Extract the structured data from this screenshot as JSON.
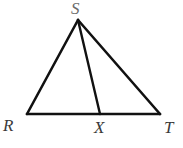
{
  "figure": {
    "background_color": "#ffffff",
    "stroke_color": "#111111",
    "label_color": "#3a3a3a",
    "apex_label_color": "#6b6b6b",
    "stroke_width": 2.6,
    "width": 183,
    "height": 148
  },
  "labels": {
    "apex": "S",
    "bottom_left": "R",
    "bottom_middle": "X",
    "bottom_right": "T"
  },
  "geometry": {
    "points": {
      "S": {
        "x": 78,
        "y": 20
      },
      "R": {
        "x": 27,
        "y": 114
      },
      "X": {
        "x": 100,
        "y": 114
      },
      "T": {
        "x": 160,
        "y": 114
      }
    },
    "segments": [
      {
        "name": "SR",
        "from": "S",
        "to": "R"
      },
      {
        "name": "RT",
        "from": "R",
        "to": "T"
      },
      {
        "name": "ST",
        "from": "S",
        "to": "T"
      },
      {
        "name": "SX",
        "from": "S",
        "to": "X"
      }
    ],
    "label_positions": {
      "S": {
        "x": 71,
        "y": 0
      },
      "R": {
        "x": 3,
        "y": 117
      },
      "X": {
        "x": 94,
        "y": 119
      },
      "T": {
        "x": 164,
        "y": 119
      }
    }
  }
}
